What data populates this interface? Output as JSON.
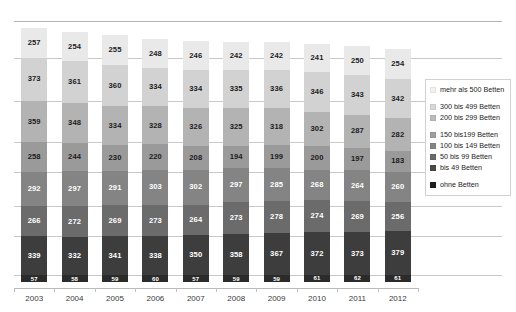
{
  "title_remnant": "",
  "chart_data": {
    "type": "bar",
    "stacked": true,
    "title": "",
    "subtitle": "",
    "xlabel": "",
    "ylabel": "",
    "grid": true,
    "legend_position": "right",
    "orientation": "vertical",
    "categories": [
      "2003",
      "2004",
      "2005",
      "2006",
      "2007",
      "2008",
      "2009",
      "2010",
      "2011",
      "2012"
    ],
    "stack_order_top_to_bottom": [
      "mehr als 500 Betten",
      "300 bis 499 Betten",
      "200 bis 299 Betten",
      "150 bis199 Betten",
      "100 bis 149 Betten",
      "50 bis 99 Betten",
      "bis 49 Betten",
      "ohne Betten"
    ],
    "series": [
      {
        "name": "mehr als 500 Betten",
        "color": "#e9e9e9",
        "label_color": "#1c1c1c",
        "values": [
          257,
          254,
          255,
          248,
          246,
          242,
          242,
          241,
          250,
          254
        ]
      },
      {
        "name": "300 bis 499 Betten",
        "color": "#d2d2d2",
        "label_color": "#1c1c1c",
        "values": [
          373,
          361,
          360,
          334,
          334,
          335,
          336,
          346,
          343,
          342
        ]
      },
      {
        "name": "200 bis 299 Betten",
        "color": "#b3b3b3",
        "label_color": "#1c1c1c",
        "values": [
          359,
          348,
          334,
          328,
          326,
          325,
          318,
          302,
          287,
          282
        ]
      },
      {
        "name": "150 bis199 Betten",
        "color": "#9a9a9a",
        "label_color": "#1c1c1c",
        "values": [
          258,
          244,
          230,
          220,
          208,
          194,
          199,
          200,
          197,
          183
        ]
      },
      {
        "name": "100 bis 149 Betten",
        "color": "#848484",
        "label_color": "#ffffff",
        "values": [
          292,
          297,
          291,
          303,
          302,
          297,
          285,
          268,
          264,
          260
        ]
      },
      {
        "name": "50 bis 99 Betten",
        "color": "#6b6b6b",
        "label_color": "#ffffff",
        "values": [
          266,
          272,
          269,
          273,
          264,
          273,
          278,
          274,
          269,
          256
        ]
      },
      {
        "name": "bis 49 Betten",
        "color": "#3d3d3d",
        "label_color": "#ffffff",
        "values": [
          339,
          332,
          341,
          338,
          350,
          358,
          367,
          372,
          373,
          379
        ]
      },
      {
        "name": "ohne Betten",
        "color": "#2b2b2b",
        "label_color": "#ffffff",
        "values": [
          57,
          58,
          59,
          60,
          57,
          59,
          59,
          61,
          62,
          61
        ]
      }
    ],
    "legend": [
      {
        "label": "mehr als 500 Betten",
        "color": "#f1f1f1"
      },
      {
        "label": "300 bis 499 Betten",
        "color": "#d8d8d8"
      },
      {
        "label": "200 bis 299 Betten",
        "color": "#bcbcbc"
      },
      {
        "label": "150 bis199 Betten",
        "color": "#9e9e9e"
      },
      {
        "label": "100 bis 149 Betten",
        "color": "#858585"
      },
      {
        "label": "50 bis 99 Betten",
        "color": "#6a6a6a"
      },
      {
        "label": "bis 49 Betten",
        "color": "#4a4a4a"
      },
      {
        "label": "ohne Betten",
        "color": "#1f1f1f"
      }
    ]
  }
}
